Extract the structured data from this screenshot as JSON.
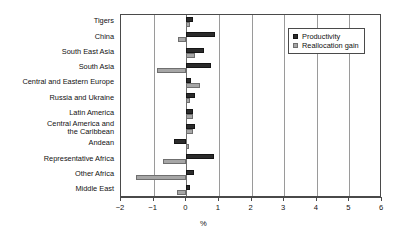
{
  "chart_data": {
    "type": "bar",
    "orientation": "horizontal",
    "title": "",
    "xlabel": "%",
    "ylabel": "",
    "xlim": [
      -2,
      6
    ],
    "xticks": [
      -2,
      -1,
      0,
      1,
      2,
      3,
      4,
      5,
      6
    ],
    "xticklabels": [
      "−2",
      "−1",
      "0",
      "1",
      "2",
      "3",
      "4",
      "5",
      "6"
    ],
    "grid": true,
    "grid_axis": "x",
    "legend_position": "top-right",
    "categories": [
      "Tigers",
      "China",
      "South East Asia",
      "South Asia",
      "Central and Eastern Europe",
      "Russia and Ukraine",
      "Latin America",
      "Central America and\nthe Caribbean",
      "Andean",
      "Representative Africa",
      "Other Africa",
      "Middle East"
    ],
    "series": [
      {
        "name": "Productivity",
        "color": "#2b2b2b",
        "values": [
          0.22,
          0.88,
          0.55,
          0.75,
          0.15,
          0.28,
          0.22,
          0.28,
          -0.38,
          0.85,
          0.25,
          0.12
        ]
      },
      {
        "name": "Reallocation gain",
        "color": "#a6a6a6",
        "values": [
          0.1,
          -0.25,
          0.28,
          -0.9,
          0.42,
          0.12,
          0.2,
          0.22,
          0.08,
          -0.7,
          -1.55,
          -0.28
        ]
      }
    ]
  },
  "legend": {
    "items": [
      {
        "label": "Productivity",
        "swatch": "dark-square-swatch"
      },
      {
        "label": "Reallocation gain",
        "swatch": "gray-square-swatch"
      }
    ]
  },
  "axis": {
    "x_title": "%"
  }
}
